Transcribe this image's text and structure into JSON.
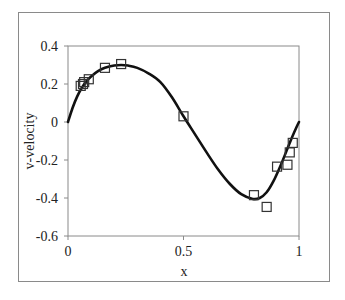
{
  "chart_data": {
    "type": "scatter",
    "title": "",
    "xlabel": "x",
    "ylabel": "v-velocity",
    "xlim": [
      0,
      1
    ],
    "ylim": [
      -0.6,
      0.4
    ],
    "xticks": [
      0,
      0.5,
      1
    ],
    "xtick_labels": [
      "0",
      "0.5",
      "1"
    ],
    "yticks": [
      0.4,
      0.2,
      0,
      -0.2,
      -0.4,
      -0.6
    ],
    "ytick_labels": [
      "0.4",
      "0.2",
      "0",
      "-0.2",
      "-0.4",
      "-0.6"
    ],
    "grid": false,
    "legend": null,
    "series": [
      {
        "name": "solution curve",
        "type": "line",
        "color": "#111111",
        "x": [
          0,
          0.02,
          0.04,
          0.06,
          0.08,
          0.1,
          0.13,
          0.16,
          0.2,
          0.23,
          0.26,
          0.3,
          0.35,
          0.4,
          0.45,
          0.5,
          0.55,
          0.6,
          0.65,
          0.7,
          0.75,
          0.8,
          0.83,
          0.86,
          0.89,
          0.92,
          0.95,
          0.97,
          0.99,
          1.0
        ],
        "y": [
          0,
          0.075,
          0.135,
          0.18,
          0.215,
          0.24,
          0.268,
          0.285,
          0.297,
          0.3,
          0.297,
          0.285,
          0.255,
          0.21,
          0.13,
          0.03,
          -0.065,
          -0.16,
          -0.25,
          -0.325,
          -0.38,
          -0.405,
          -0.4,
          -0.37,
          -0.31,
          -0.23,
          -0.14,
          -0.08,
          -0.025,
          0
        ]
      },
      {
        "name": "reference data",
        "type": "scatter",
        "marker": "square-open",
        "color": "#333333",
        "x": [
          0.055,
          0.065,
          0.07,
          0.09,
          0.16,
          0.23,
          0.5,
          0.805,
          0.86,
          0.905,
          0.95,
          0.96,
          0.973
        ],
        "y": [
          0.19,
          0.2,
          0.21,
          0.225,
          0.285,
          0.305,
          0.03,
          -0.385,
          -0.447,
          -0.235,
          -0.225,
          -0.16,
          -0.11
        ]
      }
    ]
  }
}
